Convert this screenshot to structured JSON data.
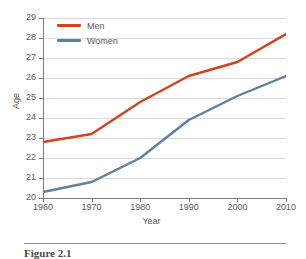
{
  "chart_data": {
    "type": "line",
    "title": "",
    "xlabel": "Year",
    "ylabel": "Age",
    "x": [
      1960,
      1970,
      1980,
      1990,
      2000,
      2010
    ],
    "xticklabels": [
      "1960",
      "1970",
      "1980",
      "1990",
      "2000",
      "2010"
    ],
    "yticklabels": [
      "20",
      "21",
      "22",
      "23",
      "24",
      "25",
      "26",
      "27",
      "28",
      "29"
    ],
    "yticks": [
      20,
      21,
      22,
      23,
      24,
      25,
      26,
      27,
      28,
      29
    ],
    "xlim": [
      1960,
      2010
    ],
    "ylim": [
      20,
      29
    ],
    "grid": "horizontal",
    "legend_position": "top-left",
    "series": [
      {
        "name": "Men",
        "color": "#d14220",
        "values": [
          22.8,
          23.2,
          24.8,
          26.1,
          26.8,
          28.2
        ]
      },
      {
        "name": "Women",
        "color": "#5f7fa3",
        "values": [
          20.3,
          20.8,
          22.0,
          23.9,
          25.1,
          26.1
        ]
      }
    ]
  },
  "legend": {
    "items": [
      {
        "label": "Men",
        "color": "#d14220"
      },
      {
        "label": "Women",
        "color": "#5f7fa3"
      }
    ]
  },
  "axes": {
    "x_title": "Year",
    "y_title": "Age"
  },
  "caption": {
    "text": "Figure 2.1"
  }
}
